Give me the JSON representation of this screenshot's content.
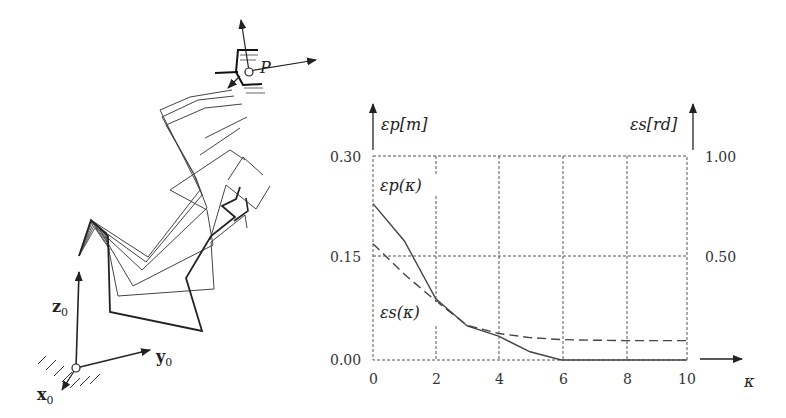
{
  "robot_figure": {
    "point_label": "P",
    "frame_labels": {
      "z": "z",
      "y": "y",
      "x": "x",
      "subscript": "0"
    }
  },
  "chart_data": {
    "type": "line",
    "title": "",
    "xlabel": "κ",
    "ylabel_left": "εp[m]",
    "ylabel_right": "εs[rd]",
    "x_ticks": [
      "0",
      "2",
      "4",
      "6",
      "8",
      "10"
    ],
    "y_ticks_left": [
      "0.00",
      "0.15",
      "0.30"
    ],
    "y_ticks_right": [
      "0.50",
      "1.00"
    ],
    "xlim": [
      0,
      10
    ],
    "ylim_left": [
      0,
      0.3
    ],
    "ylim_right": [
      0,
      1.0
    ],
    "grid": true,
    "x": [
      0,
      1,
      2,
      3,
      4,
      5,
      6,
      7,
      8,
      9,
      10
    ],
    "series": [
      {
        "name": "εp(κ)",
        "style": "solid",
        "axis": "left",
        "values": [
          0.23,
          0.175,
          0.09,
          0.05,
          0.035,
          0.012,
          0.0,
          0.0,
          0.0,
          0.0,
          0.0
        ]
      },
      {
        "name": "εs(κ)",
        "style": "dashed",
        "axis": "right",
        "values": [
          0.57,
          0.42,
          0.29,
          0.17,
          0.13,
          0.11,
          0.1,
          0.097,
          0.095,
          0.095,
          0.095
        ]
      }
    ],
    "annotations": [
      "εp(κ)",
      "εs(κ)"
    ]
  }
}
